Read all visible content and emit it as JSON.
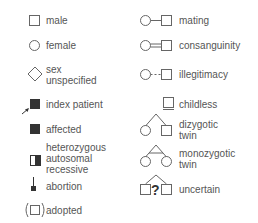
{
  "legend": {
    "left_column": [
      {
        "icon": "square-outline-icon",
        "label": "male"
      },
      {
        "icon": "circle-outline-icon",
        "label": "female"
      },
      {
        "icon": "diamond-outline-icon",
        "label_line1": "sex",
        "label_line2": "unspecified"
      },
      {
        "icon": "filled-square-arrow-icon",
        "label": "index patient"
      },
      {
        "icon": "filled-square-icon",
        "label": "affected"
      },
      {
        "icon": "half-filled-square-icon",
        "label_line1": "heterozygous",
        "label_line2": "autosomal",
        "label_line3": "recessive"
      },
      {
        "icon": "abortion-icon",
        "label": "abortion"
      },
      {
        "icon": "bracketed-square-icon",
        "label": "adopted"
      }
    ],
    "right_column": [
      {
        "icon": "mating-line-icon",
        "label": "mating"
      },
      {
        "icon": "double-line-icon",
        "label": "consanguinity"
      },
      {
        "icon": "dashed-line-icon",
        "label": "illegitimacy"
      },
      {
        "icon": "childless-icon",
        "label": "childless"
      },
      {
        "icon": "dizygotic-twin-icon",
        "label_line1": "dizygotic",
        "label_line2": "twin"
      },
      {
        "icon": "monozygotic-twin-icon",
        "label_line1": "monozygotic",
        "label_line2": "twin"
      },
      {
        "icon": "uncertain-icon",
        "label": "uncertain",
        "symbol": "?"
      }
    ]
  },
  "colors": {
    "stroke": "#666666",
    "fill": "#333333",
    "text": "#555555"
  }
}
